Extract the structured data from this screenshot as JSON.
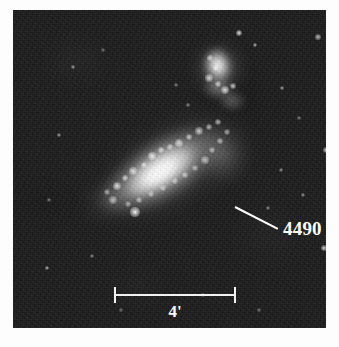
{
  "figure": {
    "name": "galaxy-plate",
    "background_color": "#fdfdfd",
    "plate_color": "#1b1b1b"
  },
  "annotations": {
    "galaxy_label": "4490",
    "leader_line": "leader-line",
    "label_color": "#ffffff"
  },
  "scale": {
    "label": "4'",
    "bar_color": "#f2f2f2",
    "text_color": "#ffffff"
  },
  "objects": [
    {
      "name": "ngc-4490-main-galaxy",
      "kind": "galaxy"
    },
    {
      "name": "ngc-4485-companion-galaxy",
      "kind": "galaxy"
    }
  ],
  "knots": [
    {
      "x": 104,
      "y": 176,
      "r": 4.0,
      "o": 0.9
    },
    {
      "x": 112,
      "y": 168,
      "r": 3.2,
      "o": 0.8
    },
    {
      "x": 120,
      "y": 161,
      "r": 3.6,
      "o": 0.85
    },
    {
      "x": 131,
      "y": 155,
      "r": 3.0,
      "o": 0.75
    },
    {
      "x": 139,
      "y": 146,
      "r": 4.4,
      "o": 0.92
    },
    {
      "x": 148,
      "y": 140,
      "r": 3.4,
      "o": 0.8
    },
    {
      "x": 157,
      "y": 137,
      "r": 3.0,
      "o": 0.72
    },
    {
      "x": 166,
      "y": 133,
      "r": 3.8,
      "o": 0.82
    },
    {
      "x": 176,
      "y": 127,
      "r": 3.2,
      "o": 0.76
    },
    {
      "x": 186,
      "y": 121,
      "r": 3.6,
      "o": 0.8
    },
    {
      "x": 196,
      "y": 117,
      "r": 3.0,
      "o": 0.7
    },
    {
      "x": 205,
      "y": 112,
      "r": 3.4,
      "o": 0.74
    },
    {
      "x": 214,
      "y": 122,
      "r": 3.0,
      "o": 0.66
    },
    {
      "x": 207,
      "y": 131,
      "r": 3.4,
      "o": 0.7
    },
    {
      "x": 199,
      "y": 140,
      "r": 3.0,
      "o": 0.64
    },
    {
      "x": 192,
      "y": 150,
      "r": 3.6,
      "o": 0.72
    },
    {
      "x": 182,
      "y": 158,
      "r": 3.0,
      "o": 0.66
    },
    {
      "x": 172,
      "y": 165,
      "r": 3.4,
      "o": 0.7
    },
    {
      "x": 162,
      "y": 171,
      "r": 3.0,
      "o": 0.64
    },
    {
      "x": 150,
      "y": 178,
      "r": 3.2,
      "o": 0.66
    },
    {
      "x": 138,
      "y": 184,
      "r": 3.0,
      "o": 0.62
    },
    {
      "x": 126,
      "y": 190,
      "r": 3.4,
      "o": 0.68
    },
    {
      "x": 115,
      "y": 194,
      "r": 3.0,
      "o": 0.6
    },
    {
      "x": 100,
      "y": 190,
      "r": 3.6,
      "o": 0.7
    },
    {
      "x": 94,
      "y": 182,
      "r": 3.0,
      "o": 0.6
    },
    {
      "x": 196,
      "y": 68,
      "r": 3.6,
      "o": 0.85
    },
    {
      "x": 205,
      "y": 74,
      "r": 3.0,
      "o": 0.78
    },
    {
      "x": 212,
      "y": 80,
      "r": 4.0,
      "o": 0.9
    },
    {
      "x": 220,
      "y": 76,
      "r": 3.2,
      "o": 0.8
    },
    {
      "x": 203,
      "y": 58,
      "r": 3.0,
      "o": 0.74
    },
    {
      "x": 197,
      "y": 48,
      "r": 2.8,
      "o": 0.7
    }
  ],
  "stars": [
    {
      "x": 122,
      "y": 202,
      "r": 4.6,
      "o": 1.0
    },
    {
      "x": 226,
      "y": 23,
      "r": 3.0,
      "o": 0.9
    },
    {
      "x": 242,
      "y": 35,
      "r": 2.4,
      "o": 0.7
    },
    {
      "x": 269,
      "y": 78,
      "r": 2.2,
      "o": 0.65
    },
    {
      "x": 305,
      "y": 27,
      "r": 2.6,
      "o": 0.75
    },
    {
      "x": 313,
      "y": 140,
      "r": 2.8,
      "o": 0.8
    },
    {
      "x": 311,
      "y": 238,
      "r": 3.0,
      "o": 0.85
    },
    {
      "x": 290,
      "y": 185,
      "r": 2.0,
      "o": 0.55
    },
    {
      "x": 268,
      "y": 160,
      "r": 2.0,
      "o": 0.55
    },
    {
      "x": 255,
      "y": 198,
      "r": 1.8,
      "o": 0.5
    },
    {
      "x": 175,
      "y": 95,
      "r": 2.0,
      "o": 0.55
    },
    {
      "x": 163,
      "y": 75,
      "r": 1.8,
      "o": 0.48
    },
    {
      "x": 60,
      "y": 57,
      "r": 2.2,
      "o": 0.62
    },
    {
      "x": 46,
      "y": 125,
      "r": 2.2,
      "o": 0.6
    },
    {
      "x": 36,
      "y": 190,
      "r": 1.8,
      "o": 0.48
    },
    {
      "x": 34,
      "y": 258,
      "r": 2.4,
      "o": 0.7
    },
    {
      "x": 79,
      "y": 246,
      "r": 1.8,
      "o": 0.48
    },
    {
      "x": 190,
      "y": 285,
      "r": 2.0,
      "o": 0.55
    },
    {
      "x": 246,
      "y": 300,
      "r": 1.8,
      "o": 0.45
    },
    {
      "x": 108,
      "y": 300,
      "r": 1.6,
      "o": 0.42
    },
    {
      "x": 286,
      "y": 108,
      "r": 1.8,
      "o": 0.48
    },
    {
      "x": 90,
      "y": 40,
      "r": 1.6,
      "o": 0.42
    }
  ]
}
